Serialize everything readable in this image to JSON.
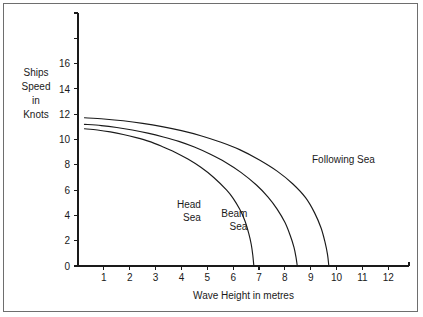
{
  "figure": {
    "border_color": "#6e6e6e",
    "background": "#ffffff",
    "ink_color": "#1a1a1a"
  },
  "chart_data": {
    "type": "line",
    "title": "",
    "xlabel": "Wave Height in metres",
    "ylabel": "Ships Speed in Knots",
    "ylabel_lines": [
      "Ships",
      "Speed",
      "in",
      "Knots"
    ],
    "xlim": [
      0,
      12.8
    ],
    "ylim": [
      0,
      20.0
    ],
    "grid": false,
    "legend_position": "inline-annotations",
    "xticks": [
      1,
      2,
      3,
      4,
      5,
      6,
      7,
      8,
      9,
      10,
      11,
      12
    ],
    "xticklabels": [
      "1",
      "2",
      "3",
      "4",
      "5",
      "6",
      "7",
      "8",
      "9",
      "10",
      "11",
      "12"
    ],
    "yticks": [
      0,
      2,
      4,
      6,
      8,
      10,
      12,
      14,
      16,
      18,
      20
    ],
    "yticklabels": [
      "0",
      "2",
      "4",
      "6",
      "8",
      "10",
      "12",
      "14",
      "16",
      "",
      ""
    ],
    "series": [
      {
        "name": "Head Sea",
        "label": "Head Sea",
        "label_lines": [
          "Head",
          "Sea"
        ],
        "label_x": 4.75,
        "label_y": 4.6,
        "x": [
          0.25,
          0.75,
          1.25,
          1.75,
          2.25,
          2.75,
          3.25,
          3.75,
          4.25,
          4.75,
          5.25,
          5.75,
          6.0,
          6.25,
          6.45,
          6.6,
          6.7,
          6.76,
          6.8
        ],
        "y": [
          10.85,
          10.75,
          10.6,
          10.4,
          10.15,
          9.85,
          9.45,
          9.0,
          8.45,
          7.8,
          7.0,
          6.0,
          5.35,
          4.5,
          3.6,
          2.6,
          1.7,
          0.85,
          0.0
        ]
      },
      {
        "name": "Beam Sea",
        "label": "Beam Sea",
        "label_lines": [
          "Beam",
          "Sea"
        ],
        "label_x": 6.55,
        "label_y": 3.85,
        "x": [
          0.25,
          0.9,
          1.5,
          2.1,
          2.7,
          3.3,
          3.9,
          4.5,
          5.1,
          5.7,
          6.3,
          6.9,
          7.35,
          7.7,
          8.0,
          8.2,
          8.35,
          8.43,
          8.48
        ],
        "y": [
          11.2,
          11.1,
          10.95,
          10.75,
          10.5,
          10.2,
          9.85,
          9.4,
          8.85,
          8.2,
          7.4,
          6.4,
          5.45,
          4.5,
          3.45,
          2.45,
          1.5,
          0.7,
          0.0
        ]
      },
      {
        "name": "Following Sea",
        "label": "Following Sea",
        "label_lines": [
          "Following Sea"
        ],
        "label_x": 9.05,
        "label_y": 8.15,
        "x": [
          0.25,
          1.0,
          1.75,
          2.5,
          3.25,
          4.0,
          4.75,
          5.5,
          6.25,
          7.0,
          7.7,
          8.3,
          8.8,
          9.15,
          9.4,
          9.55,
          9.65,
          9.7
        ],
        "y": [
          11.72,
          11.62,
          11.48,
          11.28,
          11.02,
          10.7,
          10.3,
          9.8,
          9.2,
          8.4,
          7.5,
          6.5,
          5.4,
          4.2,
          3.0,
          1.9,
          0.9,
          0.0
        ]
      }
    ]
  }
}
